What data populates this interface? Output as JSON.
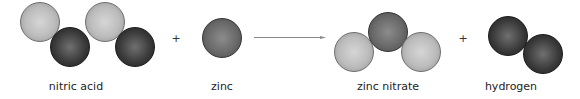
{
  "equation": {
    "reactants": [
      {
        "label": "nitric acid",
        "spheres": [
          {
            "type": "light",
            "cx": 40,
            "cy": 22
          },
          {
            "type": "dark",
            "cx": 70,
            "cy": 47
          },
          {
            "type": "light",
            "cx": 105,
            "cy": 22
          },
          {
            "type": "dark",
            "cx": 135,
            "cy": 47
          }
        ]
      },
      {
        "label": "zinc",
        "spheres": [
          {
            "type": "mid",
            "cx": 222,
            "cy": 38
          }
        ]
      }
    ],
    "products": [
      {
        "label": "zinc nitrate",
        "spheres": [
          {
            "type": "light",
            "cx": 354,
            "cy": 52
          },
          {
            "type": "mid",
            "cx": 388,
            "cy": 32
          },
          {
            "type": "light",
            "cx": 421,
            "cy": 52
          }
        ]
      },
      {
        "label": "hydrogen",
        "spheres": [
          {
            "type": "dark",
            "cx": 508,
            "cy": 36
          },
          {
            "type": "dark",
            "cx": 543,
            "cy": 54
          }
        ]
      }
    ],
    "plus_symbol": "+",
    "arrow_icon": "right-arrow-icon",
    "colors": {
      "light": "#bcbcbc",
      "mid": "#6a6a6a",
      "dark": "#3c3c3c",
      "arrow": "#888888"
    }
  }
}
